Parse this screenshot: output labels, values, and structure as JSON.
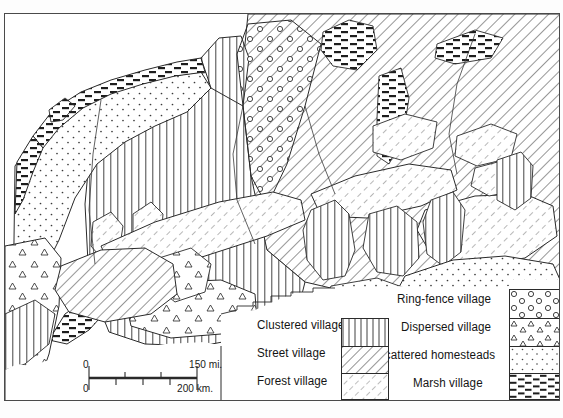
{
  "map": {
    "title": "Rural settlement types of northwestern Europe",
    "frame": {
      "x": 4,
      "y": 13,
      "w": 556,
      "h": 388,
      "border_color": "#4a4a4a"
    }
  },
  "legend": {
    "entries": [
      {
        "key": "clustered",
        "label": "Clustered village",
        "pattern": "vertical-lines",
        "column": "left",
        "swatch_row": 0
      },
      {
        "key": "street",
        "label": "Street village",
        "pattern": "diagonal-hatch-dense",
        "column": "left",
        "swatch_row": 1
      },
      {
        "key": "forest",
        "label": "Forest village",
        "pattern": "diagonal-hatch-light",
        "column": "left",
        "swatch_row": 2
      },
      {
        "key": "ringfence",
        "label": "Ring-fence village",
        "pattern": "circles",
        "column": "right",
        "swatch_row": 0
      },
      {
        "key": "dispersed",
        "label": "Dispersed village",
        "pattern": "triangles",
        "column": "right",
        "swatch_row": 1
      },
      {
        "key": "scattered",
        "label": "Scattered homesteads",
        "pattern": "dots",
        "column": "right",
        "swatch_row": 2
      },
      {
        "key": "marsh",
        "label": "Marsh village",
        "pattern": "horizontal-bricks",
        "column": "right",
        "swatch_row": 3
      }
    ]
  },
  "scale_bar": {
    "miles_zero": "0",
    "miles_max": "150  mi.",
    "km_zero": "0",
    "km_max": "200  km."
  },
  "colors": {
    "ink": "#1a1a1a",
    "frame": "#4a4a4a",
    "paper": "#ffffff",
    "hatch": "#303030"
  }
}
